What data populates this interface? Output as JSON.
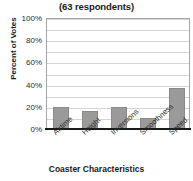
{
  "chart_data": {
    "type": "bar",
    "title": "7th Graders",
    "subtitle": "(63 respondents)",
    "xlabel": "Coaster Characteristics",
    "ylabel": "Percent of Votes",
    "categories": [
      "Airtime",
      "Height",
      "Inversions",
      "Smoothness",
      "Speed"
    ],
    "values": [
      20,
      16,
      20,
      10,
      37
    ],
    "ylim": [
      0,
      100
    ],
    "ytick_labels": [
      "100%",
      "80%",
      "60%",
      "40%",
      "20%",
      "0%"
    ],
    "ytick_values": [
      100,
      80,
      60,
      40,
      20,
      0
    ],
    "gridline_values": [
      10,
      20,
      30,
      40,
      50,
      60,
      70,
      80,
      90,
      100
    ],
    "grid": true,
    "legend": "none",
    "bar_color": "#9a9a9a",
    "bar_border_color": "#8a8a8a",
    "gridline_color": "#d4d4d4",
    "axis_color": "#1a1a1a",
    "plot_border_color": "#a6a6a6",
    "n_respondents": 63
  }
}
